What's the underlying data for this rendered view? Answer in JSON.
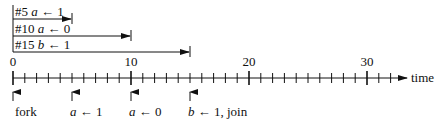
{
  "timeline": {
    "axis_label": "time",
    "start": 0,
    "end": 32,
    "major_ticks": [
      {
        "value": 0,
        "label": "0"
      },
      {
        "value": 10,
        "label": "10"
      },
      {
        "value": 20,
        "label": "20"
      },
      {
        "value": 30,
        "label": "30"
      }
    ]
  },
  "delays": [
    {
      "text_prefix": "#5 ",
      "var": "a",
      "op": " ← ",
      "val": "1",
      "end": 5
    },
    {
      "text_prefix": "#10 ",
      "var": "a",
      "op": " ← ",
      "val": "0",
      "end": 10
    },
    {
      "text_prefix": "#15 ",
      "var": "b",
      "op": " ← ",
      "val": "1",
      "end": 15
    }
  ],
  "events": [
    {
      "at": 0,
      "var": "",
      "rest": "fork"
    },
    {
      "at": 5,
      "var": "a",
      "rest": " ← 1"
    },
    {
      "at": 10,
      "var": "a",
      "rest": " ← 0"
    },
    {
      "at": 15,
      "var": "b",
      "rest": " ← 1, join"
    }
  ]
}
